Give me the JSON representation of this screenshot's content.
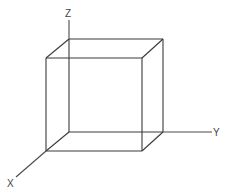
{
  "diagram": {
    "type": "3d-coordinate-cube",
    "colors": {
      "edge": "#3a3a3a",
      "axis": "#4a4a4a",
      "label": "#444444",
      "background": "#ffffff"
    },
    "axes": [
      {
        "id": "z",
        "label": "Z",
        "from": [
          69,
          39
        ],
        "to": [
          69,
          20
        ],
        "label_pos": [
          66,
          17
        ]
      },
      {
        "id": "y",
        "label": "Y",
        "from": [
          163,
          132
        ],
        "to": [
          212,
          132
        ],
        "label_pos": [
          213,
          136
        ]
      },
      {
        "id": "x",
        "label": "X",
        "from": [
          46,
          151
        ],
        "to": [
          16,
          177
        ],
        "label_pos": [
          7,
          187
        ]
      }
    ],
    "cube": {
      "front_face": {
        "x1": 46,
        "y1": 58,
        "x2": 142,
        "y2": 151
      },
      "back_face": {
        "x1": 69,
        "y1": 39,
        "x2": 163,
        "y2": 132
      }
    }
  }
}
